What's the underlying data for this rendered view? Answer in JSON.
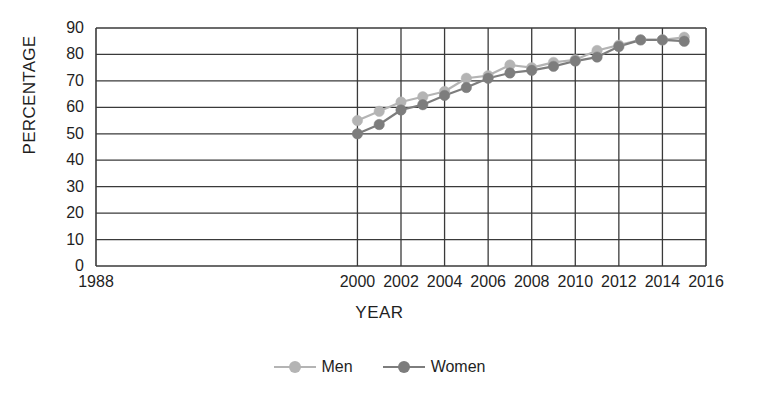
{
  "chart_data": {
    "type": "line",
    "title": "",
    "xlabel": "YEAR",
    "ylabel": "PERCENTAGE",
    "xlim": [
      1988,
      2016
    ],
    "ylim": [
      0,
      90
    ],
    "grid": true,
    "legend_position": "bottom",
    "x_tick_labels": [
      "1988",
      "2000",
      "2002",
      "2004",
      "2006",
      "2008",
      "2010",
      "2012",
      "2014",
      "2016"
    ],
    "y_tick_labels": [
      "0",
      "10",
      "20",
      "30",
      "40",
      "50",
      "60",
      "70",
      "80",
      "90"
    ],
    "x": [
      2000,
      2001,
      2002,
      2003,
      2004,
      2005,
      2006,
      2007,
      2008,
      2009,
      2010,
      2011,
      2012,
      2013,
      2014,
      2015
    ],
    "series": [
      {
        "name": "Men",
        "color": "#b4b4b4",
        "values": [
          55,
          58.5,
          62,
          64,
          66,
          71,
          72,
          76,
          75,
          77,
          78,
          81.5,
          83.5,
          85.5,
          85.5,
          86.5
        ]
      },
      {
        "name": "Women",
        "color": "#7d7d7d",
        "values": [
          50,
          53.5,
          59,
          61,
          64.5,
          67.5,
          71,
          73,
          74,
          75.5,
          77.5,
          79,
          83,
          85.5,
          85.5,
          85
        ]
      }
    ]
  },
  "legend": {
    "items": [
      {
        "label": "Men",
        "color": "#b4b4b4"
      },
      {
        "label": "Women",
        "color": "#7d7d7d"
      }
    ]
  },
  "axes": {
    "y_title": "PERCENTAGE",
    "x_title": "YEAR"
  }
}
